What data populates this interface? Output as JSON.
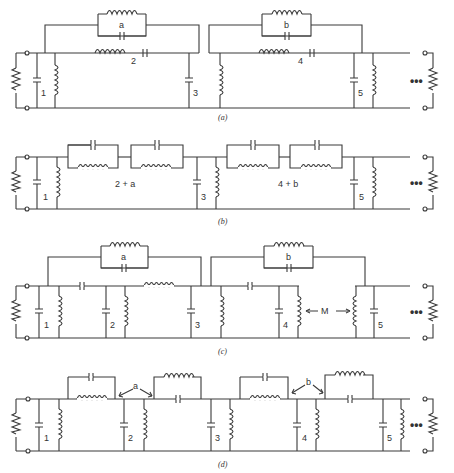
{
  "figure": {
    "panels": [
      {
        "id": "a",
        "caption": "(a)",
        "labels": {
          "c1": "1",
          "series2": "2",
          "c3": "3",
          "series4": "4",
          "c5": "5",
          "bridge_a": "a",
          "bridge_b": "b"
        }
      },
      {
        "id": "b",
        "caption": "(b)",
        "labels": {
          "c1": "1",
          "combo_a": "2 + a",
          "c3": "3",
          "combo_b": "4 + b",
          "c5": "5"
        }
      },
      {
        "id": "c",
        "caption": "(c)",
        "labels": {
          "c1": "1",
          "c2": "2",
          "c3": "3",
          "c4": "4",
          "c5": "5",
          "bridge_a": "a",
          "bridge_b": "b",
          "mutual": "M"
        }
      },
      {
        "id": "d",
        "caption": "(d)",
        "labels": {
          "c1": "1",
          "c2": "2",
          "c3": "3",
          "c4": "4",
          "c5": "5",
          "arrow_a": "a",
          "arrow_b": "b"
        }
      }
    ],
    "continuation": "•••"
  }
}
